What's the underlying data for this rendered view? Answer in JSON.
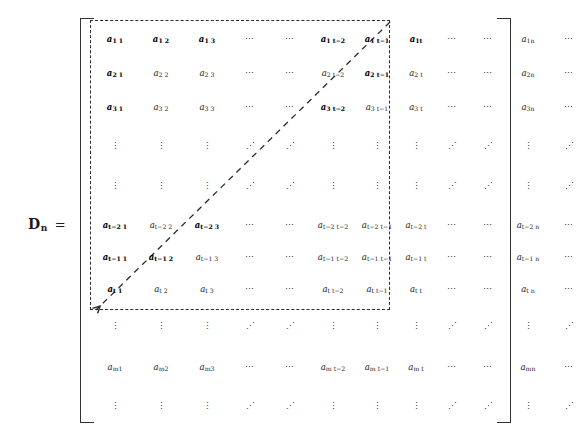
{
  "equation": {
    "matrix_symbol": "D",
    "matrix_subscript": "n",
    "equals": "="
  },
  "glyphs": {
    "hdots": "⋯",
    "vdots": "⋮",
    "ddots": "⋰"
  },
  "matrix": {
    "column_count": 13,
    "row_count": 12,
    "rows": [
      {
        "kind": "data",
        "cells": [
          {
            "t": "a",
            "sub": "1 1",
            "bold": true
          },
          {
            "t": "a",
            "sub": "1 2",
            "bold": true
          },
          {
            "t": "a",
            "sub": "1 3",
            "bold": true
          },
          {
            "t": "hdots"
          },
          {
            "t": "hdots"
          },
          {
            "t": "a",
            "sub": "1 t−2",
            "bold": true
          },
          {
            "t": "a",
            "sub": "1 t−1",
            "bold": true
          },
          {
            "t": "a",
            "sub": "1t",
            "bold": true
          },
          {
            "t": "hdots"
          },
          {
            "t": "hdots"
          },
          {
            "t": "a",
            "sub": "1n",
            "bold": false
          },
          {
            "t": "hdots"
          }
        ]
      },
      {
        "kind": "data",
        "cells": [
          {
            "t": "a",
            "sub": "2 1",
            "bold": true
          },
          {
            "t": "a",
            "sub": "2 2",
            "bold": false
          },
          {
            "t": "a",
            "sub": "2 3",
            "bold": false
          },
          {
            "t": "hdots"
          },
          {
            "t": "hdots"
          },
          {
            "t": "a",
            "sub": "2 t−2",
            "bold": false
          },
          {
            "t": "a",
            "sub": "2 t−1",
            "bold": true
          },
          {
            "t": "a",
            "sub": "2 t",
            "bold": false
          },
          {
            "t": "hdots"
          },
          {
            "t": "hdots"
          },
          {
            "t": "a",
            "sub": "2n",
            "bold": false
          },
          {
            "t": "hdots"
          }
        ]
      },
      {
        "kind": "data",
        "cells": [
          {
            "t": "a",
            "sub": "3 1",
            "bold": true
          },
          {
            "t": "a",
            "sub": "3 2",
            "bold": false
          },
          {
            "t": "a",
            "sub": "3 3",
            "bold": false
          },
          {
            "t": "hdots"
          },
          {
            "t": "hdots"
          },
          {
            "t": "a",
            "sub": "3 t−2",
            "bold": true
          },
          {
            "t": "a",
            "sub": "3 t−1",
            "bold": false
          },
          {
            "t": "a",
            "sub": "3 t",
            "bold": false
          },
          {
            "t": "hdots"
          },
          {
            "t": "hdots"
          },
          {
            "t": "a",
            "sub": "3n",
            "bold": false
          },
          {
            "t": "hdots"
          }
        ]
      },
      {
        "kind": "dots",
        "cells": [
          {
            "t": "vdots"
          },
          {
            "t": "vdots"
          },
          {
            "t": "vdots"
          },
          {
            "t": "ddots"
          },
          {
            "t": "ddots"
          },
          {
            "t": "vdots"
          },
          {
            "t": "vdots"
          },
          {
            "t": "vdots"
          },
          {
            "t": "ddots"
          },
          {
            "t": "ddots"
          },
          {
            "t": "vdots"
          },
          {
            "t": "ddots"
          }
        ]
      },
      {
        "kind": "dots",
        "cells": [
          {
            "t": "vdots"
          },
          {
            "t": "vdots"
          },
          {
            "t": "vdots"
          },
          {
            "t": "ddots"
          },
          {
            "t": "ddots"
          },
          {
            "t": "vdots"
          },
          {
            "t": "vdots"
          },
          {
            "t": "vdots"
          },
          {
            "t": "ddots"
          },
          {
            "t": "ddots"
          },
          {
            "t": "vdots"
          },
          {
            "t": "ddots"
          }
        ]
      },
      {
        "kind": "data",
        "cells": [
          {
            "t": "a",
            "sub": "t−2 1",
            "bold": true
          },
          {
            "t": "a",
            "sub": "t−2 2",
            "bold": false
          },
          {
            "t": "a",
            "sub": "t−2 3",
            "bold": true
          },
          {
            "t": "hdots"
          },
          {
            "t": "hdots"
          },
          {
            "t": "a",
            "sub": "t−2 t−2",
            "bold": false
          },
          {
            "t": "a",
            "sub": "t−2 t−1",
            "bold": false
          },
          {
            "t": "a",
            "sub": "t−2 t",
            "bold": false
          },
          {
            "t": "hdots"
          },
          {
            "t": "hdots"
          },
          {
            "t": "a",
            "sub": "t−2 n",
            "bold": false
          },
          {
            "t": "hdots"
          }
        ]
      },
      {
        "kind": "data",
        "cells": [
          {
            "t": "a",
            "sub": "t−1 1",
            "bold": true
          },
          {
            "t": "a",
            "sub": "t−1 2",
            "bold": true
          },
          {
            "t": "a",
            "sub": "t−1 3",
            "bold": false
          },
          {
            "t": "hdots"
          },
          {
            "t": "hdots"
          },
          {
            "t": "a",
            "sub": "t−1 t−2",
            "bold": false
          },
          {
            "t": "a",
            "sub": "t−1 t−1",
            "bold": false
          },
          {
            "t": "a",
            "sub": "t−1 t",
            "bold": false
          },
          {
            "t": "hdots"
          },
          {
            "t": "hdots"
          },
          {
            "t": "a",
            "sub": "t−1 n",
            "bold": false
          },
          {
            "t": "hdots"
          }
        ]
      },
      {
        "kind": "data",
        "cells": [
          {
            "t": "a",
            "sub": "t 1",
            "bold": true
          },
          {
            "t": "a",
            "sub": "t 2",
            "bold": false
          },
          {
            "t": "a",
            "sub": "t 3",
            "bold": false
          },
          {
            "t": "hdots"
          },
          {
            "t": "hdots"
          },
          {
            "t": "a",
            "sub": "t t−2",
            "bold": false
          },
          {
            "t": "a",
            "sub": "t t−1",
            "bold": false
          },
          {
            "t": "a",
            "sub": "t t",
            "bold": false
          },
          {
            "t": "hdots"
          },
          {
            "t": "hdots"
          },
          {
            "t": "a",
            "sub": "t n",
            "bold": false
          },
          {
            "t": "hdots"
          }
        ]
      },
      {
        "kind": "dots",
        "cells": [
          {
            "t": "vdots"
          },
          {
            "t": "vdots"
          },
          {
            "t": "vdots"
          },
          {
            "t": "ddots"
          },
          {
            "t": "ddots"
          },
          {
            "t": "vdots"
          },
          {
            "t": "vdots"
          },
          {
            "t": "vdots"
          },
          {
            "t": "ddots"
          },
          {
            "t": "ddots"
          },
          {
            "t": "vdots"
          },
          {
            "t": "ddots"
          }
        ]
      },
      {
        "kind": "data",
        "cells": [
          {
            "t": "a",
            "sub": "m1",
            "bold": false
          },
          {
            "t": "a",
            "sub": "m2",
            "bold": false
          },
          {
            "t": "a",
            "sub": "m3",
            "bold": false
          },
          {
            "t": "hdots"
          },
          {
            "t": "hdots"
          },
          {
            "t": "a",
            "sub": "m t−2",
            "bold": false
          },
          {
            "t": "a",
            "sub": "m t−1",
            "bold": false
          },
          {
            "t": "a",
            "sub": "m t",
            "bold": false
          },
          {
            "t": "hdots"
          },
          {
            "t": "hdots"
          },
          {
            "t": "a",
            "sub": "mn",
            "bold": false
          },
          {
            "t": "hdots"
          }
        ]
      },
      {
        "kind": "dots",
        "cells": [
          {
            "t": "vdots"
          },
          {
            "t": "vdots"
          },
          {
            "t": "vdots"
          },
          {
            "t": "ddots"
          },
          {
            "t": "ddots"
          },
          {
            "t": "vdots"
          },
          {
            "t": "vdots"
          },
          {
            "t": "vdots"
          },
          {
            "t": "ddots"
          },
          {
            "t": "ddots"
          },
          {
            "t": "vdots"
          },
          {
            "t": "ddots"
          }
        ]
      }
    ]
  },
  "annotations": {
    "dashed_box_name": "highlighted-submatrix-region",
    "dashed_arrow_name": "anti-diagonal-arrow"
  }
}
